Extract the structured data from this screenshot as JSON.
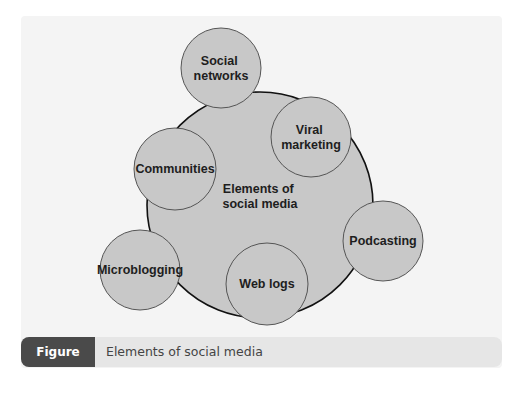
{
  "figure": {
    "label": "Figure 19.3",
    "caption": "Elements of social media"
  },
  "colors": {
    "panel_bg": "#f4f4f4",
    "circle_fill": "#c8c8c8",
    "main_stroke": "#111111",
    "node_stroke": "#555555",
    "caption_bar_bg": "#e6e6e6",
    "badge_bg": "#4a4a4a"
  },
  "diagram": {
    "center": {
      "lines": [
        "Elements of",
        "social media"
      ],
      "cx": 260,
      "cy": 205,
      "r": 113
    },
    "nodes": [
      {
        "id": "social-networks",
        "lines": [
          "Social",
          "networks"
        ],
        "cx": 221,
        "cy": 68,
        "r": 40
      },
      {
        "id": "viral-marketing",
        "lines": [
          "Viral",
          "marketing"
        ],
        "cx": 311,
        "cy": 137,
        "r": 40
      },
      {
        "id": "communities",
        "lines": [
          "Communities"
        ],
        "cx": 175,
        "cy": 169,
        "r": 41
      },
      {
        "id": "podcasting",
        "lines": [
          "Podcasting"
        ],
        "cx": 383,
        "cy": 241,
        "r": 40
      },
      {
        "id": "microblogging",
        "lines": [
          "Microblogging"
        ],
        "cx": 140,
        "cy": 270,
        "r": 40
      },
      {
        "id": "web-logs",
        "lines": [
          "Web logs"
        ],
        "cx": 267,
        "cy": 284,
        "r": 41
      }
    ]
  }
}
